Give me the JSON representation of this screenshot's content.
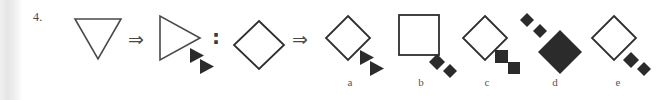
{
  "exercise": {
    "item_number": "4.",
    "type": "visual-analogy-multiple-choice",
    "relation_symbol": "⇒",
    "proportion_symbol": ":",
    "stem": {
      "source": {
        "shape": "triangle",
        "fill": "outline",
        "orientation": "pointing-down",
        "satellites": []
      },
      "target": {
        "shape": "triangle",
        "fill": "outline",
        "orientation": "pointing-right",
        "satellites": [
          {
            "shape": "triangle",
            "fill": "solid",
            "orientation": "pointing-right",
            "size": "small"
          },
          {
            "shape": "triangle",
            "fill": "solid",
            "orientation": "pointing-right",
            "size": "small"
          }
        ],
        "satellite_position": "lower-right-diagonal"
      }
    },
    "analog": {
      "source": {
        "shape": "square",
        "fill": "outline",
        "orientation": "rotated-45-diamond",
        "satellites": []
      }
    },
    "options": [
      {
        "label": "a",
        "shape": "square",
        "fill": "outline",
        "orientation": "rotated-45-diamond",
        "satellites": [
          {
            "shape": "triangle",
            "fill": "solid",
            "orientation": "pointing-right",
            "size": "small"
          },
          {
            "shape": "triangle",
            "fill": "solid",
            "orientation": "pointing-right",
            "size": "small"
          }
        ],
        "satellite_position": "lower-right-diagonal"
      },
      {
        "label": "b",
        "shape": "square",
        "fill": "outline",
        "orientation": "upright",
        "satellites": [
          {
            "shape": "square",
            "fill": "solid",
            "orientation": "rotated-45-diamond",
            "size": "small"
          },
          {
            "shape": "square",
            "fill": "solid",
            "orientation": "rotated-45-diamond",
            "size": "small"
          }
        ],
        "satellite_position": "lower-right-diagonal"
      },
      {
        "label": "c",
        "shape": "square",
        "fill": "outline",
        "orientation": "rotated-45-diamond",
        "satellites": [
          {
            "shape": "square",
            "fill": "solid",
            "orientation": "upright",
            "size": "small"
          },
          {
            "shape": "square",
            "fill": "solid",
            "orientation": "upright",
            "size": "small"
          }
        ],
        "satellite_position": "lower-right-diagonal"
      },
      {
        "label": "d",
        "shape": "square",
        "fill": "solid",
        "orientation": "rotated-45-diamond",
        "satellites": [
          {
            "shape": "square",
            "fill": "solid",
            "orientation": "rotated-45-diamond",
            "size": "small"
          },
          {
            "shape": "square",
            "fill": "solid",
            "orientation": "rotated-45-diamond",
            "size": "small"
          }
        ],
        "satellite_position": "upper-left-diagonal"
      },
      {
        "label": "e",
        "shape": "square",
        "fill": "outline",
        "orientation": "rotated-45-diamond",
        "satellites": [
          {
            "shape": "square",
            "fill": "solid",
            "orientation": "rotated-45-diamond",
            "size": "small"
          },
          {
            "shape": "square",
            "fill": "solid",
            "orientation": "rotated-45-diamond",
            "size": "small"
          }
        ],
        "satellite_position": "lower-right-diagonal"
      }
    ]
  },
  "colors": {
    "ink": "#2e2e2e",
    "outline": "#4a4a4a",
    "solid_fill": "#2b2b2b",
    "label_text": "#555555",
    "page_background": "#ffffff",
    "page_edge": "#e6e6e6"
  }
}
